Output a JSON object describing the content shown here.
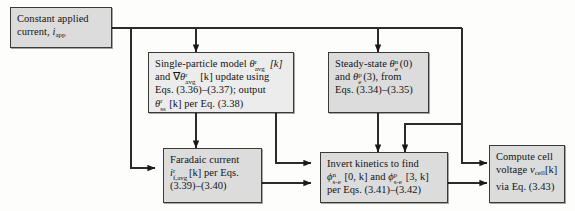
{
  "diagram": {
    "background_color": "#fdfdfb",
    "box_fill_color": "#dcdcdc",
    "box_border_color": "#3a3a3a",
    "wire_color": "#2b2b2b"
  },
  "boxes": {
    "constant_current": {
      "name": "constant-applied-current",
      "lines": [
        "Constant applied",
        "current, i_app"
      ],
      "line1": "Constant applied",
      "line2_prefix": "current, ",
      "line2_symbol": "i",
      "line2_sub": "app"
    },
    "single_particle": {
      "name": "single-particle-model",
      "line1_prefix": "Single-particle model ",
      "line1_symbol": "θ",
      "line1_sup": "r",
      "line1_sub": "avg",
      "line1_suffix": "[k]",
      "line2_prefix": "and ",
      "line2_grad": "∇",
      "line2_symbol": "θ",
      "line2_sup": "r",
      "line2_sub": "avg",
      "line2_suffix": "[k] update using",
      "line3": "Eqs. (3.36)–(3.37); output",
      "line4_symbol": "θ",
      "line4_sup": "r",
      "line4_sub": "ss",
      "line4_suffix": "[k] per Eq. (3.38)"
    },
    "steady_state": {
      "name": "steady-state",
      "line1_prefix": "Steady-state ",
      "line1_symbol": "θ",
      "line1_sup": "n",
      "line1_sub": "e",
      "line1_suffix": "(0)",
      "line2_prefix": "and ",
      "line2_symbol": "θ",
      "line2_sup": "p",
      "line2_sub": "e",
      "line2_suffix": "(3), from",
      "line3": "Eqs. (3.34)–(3.35)"
    },
    "faradaic_current": {
      "name": "faradaic-current",
      "line1": "Faradaic current",
      "line2_symbol": "i",
      "line2_sup": "r",
      "line2_sub": "f,avg",
      "line2_suffix": "[k] per Eqs.",
      "line3": "(3.39)–(3.40)"
    },
    "invert_kinetics": {
      "name": "invert-kinetics",
      "line1": "Invert kinetics to find",
      "line2_symbol": "ϕ",
      "line2_sup": "n",
      "line2_sub": "s-e",
      "line2_mid": "[0, k] and ",
      "line2_symbol2": "ϕ",
      "line2_sup2": "p",
      "line2_sub2": "s-e",
      "line2_suffix": "[3, k]",
      "line3": "per Eqs. (3.41)–(3.42)"
    },
    "compute_voltage": {
      "name": "compute-cell-voltage",
      "line1": "Compute cell",
      "line2_prefix": "voltage ",
      "line2_symbol": "v",
      "line2_sub": "cell",
      "line2_suffix": "[k]",
      "line3": "via Eq. (3.43)"
    }
  },
  "connections": [
    {
      "from": "constant-applied-current",
      "to": "single-particle-model",
      "type": "arrow"
    },
    {
      "from": "constant-applied-current",
      "to": "steady-state",
      "type": "arrow"
    },
    {
      "from": "constant-applied-current",
      "to": "faradaic-current",
      "type": "arrow"
    },
    {
      "from": "constant-applied-current",
      "to": "invert-kinetics",
      "type": "arrow"
    },
    {
      "from": "constant-applied-current",
      "to": "compute-cell-voltage",
      "type": "arrow"
    },
    {
      "from": "single-particle-model",
      "to": "faradaic-current",
      "type": "arrow"
    },
    {
      "from": "single-particle-model",
      "to": "invert-kinetics",
      "type": "arrow"
    },
    {
      "from": "steady-state",
      "to": "invert-kinetics",
      "type": "arrow"
    },
    {
      "from": "faradaic-current",
      "to": "invert-kinetics",
      "type": "arrow"
    },
    {
      "from": "invert-kinetics",
      "to": "compute-cell-voltage",
      "type": "arrow"
    }
  ]
}
